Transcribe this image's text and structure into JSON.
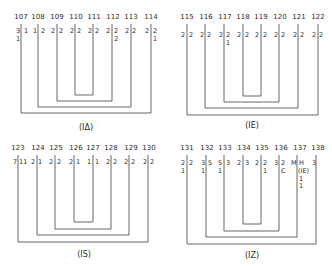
{
  "panels": [
    {
      "caption": "(IΔ)",
      "numbers": [
        "107",
        "108",
        "109",
        "110",
        "111",
        "112",
        "113",
        "114"
      ],
      "left": [
        [
          "3",
          "1"
        ],
        [
          "1"
        ],
        [
          "2"
        ],
        [
          "2"
        ],
        [
          "2"
        ],
        [
          "2"
        ],
        [
          "2"
        ],
        [
          "2"
        ]
      ],
      "right": [
        [
          "1"
        ],
        [
          "2"
        ],
        [
          "2"
        ],
        [
          "2"
        ],
        [
          "2"
        ],
        [
          "2",
          "2"
        ],
        [
          "2"
        ],
        [
          "2",
          "1"
        ]
      ]
    },
    {
      "caption": "(IE)",
      "numbers": [
        "115",
        "116",
        "117",
        "118",
        "119",
        "120",
        "121",
        "122"
      ],
      "left": [
        [
          "2"
        ],
        [
          "2"
        ],
        [
          "2"
        ],
        [
          "2"
        ],
        [
          "2"
        ],
        [
          "2"
        ],
        [
          "2"
        ],
        [
          "2"
        ]
      ],
      "right": [
        [
          "2"
        ],
        [
          "2"
        ],
        [
          "2",
          "1"
        ],
        [
          "2"
        ],
        [
          "2"
        ],
        [
          "2"
        ],
        [
          "2"
        ],
        [
          "2"
        ]
      ]
    },
    {
      "caption": "(IS)",
      "numbers": [
        "123",
        "124",
        "125",
        "126",
        "127",
        "128",
        "129",
        "130"
      ],
      "left": [
        [
          "7"
        ],
        [
          "2"
        ],
        [
          "2"
        ],
        [
          "2"
        ],
        [
          "1"
        ],
        [
          "2"
        ],
        [
          "2"
        ],
        [
          "2"
        ]
      ],
      "right": [
        [
          "11"
        ],
        [
          "1"
        ],
        [
          "2"
        ],
        [
          "1"
        ],
        [
          "1"
        ],
        [
          "2"
        ],
        [
          "2"
        ],
        [
          "2"
        ]
      ]
    },
    {
      "caption": "(IZ)",
      "numbers": [
        "131",
        "132",
        "133",
        "134",
        "135",
        "136",
        "137",
        "138"
      ],
      "left": [
        [
          "2",
          "1"
        ],
        [
          "3",
          "1"
        ],
        [
          "5",
          "1"
        ],
        [
          "2"
        ],
        [
          "2"
        ],
        [
          "3"
        ],
        [
          "M"
        ],
        [
          "3"
        ]
      ],
      "right": [
        [
          "2"
        ],
        [
          "5"
        ],
        [
          "3"
        ],
        [
          "3"
        ],
        [
          "2",
          "1"
        ],
        [
          "2",
          "C"
        ],
        [
          "H",
          "(IE)",
          "1",
          "1"
        ],
        []
      ]
    }
  ]
}
